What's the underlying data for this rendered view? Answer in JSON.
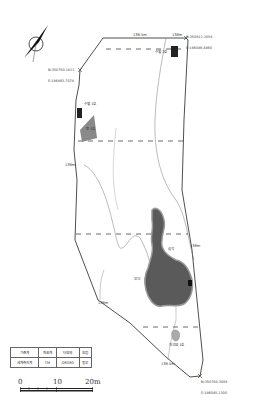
{
  "map": {
    "north_arrow": {
      "icon": "north-arrow-icon"
    },
    "corner_coordinates": {
      "northwest": [
        "N:350750.1821",
        "E:186463.7074"
      ],
      "northeast": [
        "N:350812.2054",
        "E:186046.4460"
      ],
      "southeast": [
        "N:350700.3088",
        "E:186045.1300"
      ]
    },
    "elevation_labels": [
      "138.5m",
      "138m",
      "138m",
      "138m",
      "138m",
      "138.5m"
    ],
    "features": {
      "pit_2": "수혈 2호",
      "pit_1": "수혈 1호",
      "grey_area": "토 1호",
      "stone_area_upper": "삼석",
      "stone_area_lower": "부석",
      "dolmen": "지석묘 1호"
    },
    "colors": {
      "boundary": "#222222",
      "contour": "#777777",
      "dashed_line": "#444444",
      "grey_fill": "#8a8a8a",
      "stone_fill": "#555555",
      "pit_fill": "#222222"
    }
  },
  "legend_table": {
    "headers": [
      "기준계",
      "좌표계",
      "타원체",
      "원점"
    ],
    "values": [
      "세계측지계",
      "TM",
      "GRS80",
      "동부"
    ]
  },
  "scale_bar": {
    "ticks": [
      "0",
      "10",
      "20m"
    ]
  }
}
